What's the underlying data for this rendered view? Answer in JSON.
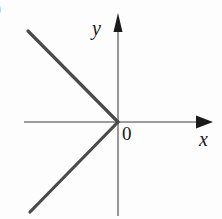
{
  "figure": {
    "width": 222,
    "height": 219,
    "background_color": "#fdfdfd",
    "corner_mark": ")"
  },
  "labels": {
    "x_axis": "x",
    "y_axis": "y",
    "origin": "0"
  },
  "colors": {
    "axis": "#7d7d7d",
    "arrow": "#1a1a1a",
    "curve": "#4a4a4a",
    "text": "#1a1a1a"
  },
  "chart_data": {
    "type": "line",
    "title": "",
    "xlabel": "x",
    "ylabel": "y",
    "grid": false,
    "legend": null,
    "annotations": [
      "0"
    ],
    "axes": {
      "origin_px": [
        118,
        122
      ],
      "x_axis_px": {
        "from": [
          24,
          122
        ],
        "to": [
          213,
          122
        ],
        "arrow_at": "to"
      },
      "y_axis_px": {
        "from": [
          118,
          215
        ],
        "to": [
          118,
          14
        ],
        "arrow_at": "to"
      },
      "xlim": [
        -1.0,
        0.55
      ],
      "ylim": [
        -0.78,
        0.62
      ]
    },
    "series": [
      {
        "name": "upper-ray",
        "points_px": [
          [
            118,
            122
          ],
          [
            28,
            31
          ]
        ],
        "points": [
          [
            0,
            0
          ],
          [
            -0.75,
            0.76
          ]
        ]
      },
      {
        "name": "lower-ray",
        "points_px": [
          [
            118,
            122
          ],
          [
            30,
            212
          ]
        ],
        "points": [
          [
            0,
            0
          ],
          [
            -0.73,
            -0.75
          ]
        ]
      }
    ]
  }
}
